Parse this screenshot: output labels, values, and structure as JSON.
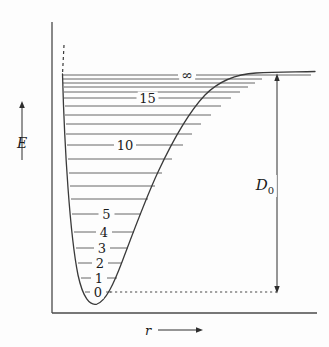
{
  "chart_data": {
    "type": "line",
    "title": "",
    "subtitle": "",
    "xlabel": "r",
    "ylabel": "E",
    "xlim": [
      0,
      1
    ],
    "ylim": [
      0,
      1
    ],
    "grid": false,
    "legend": null,
    "curve": {
      "name": "Morse potential V(r)",
      "color": "#3a3a3a",
      "asymptote_y_px": 75,
      "minimum": {
        "r_px": 96,
        "E_px": 302
      }
    },
    "dissociation_energy": {
      "label_base": "D",
      "label_sub": "0",
      "from_level": 0,
      "to_level": "dissociation limit",
      "arrow": "double-headed"
    },
    "levels": [
      {
        "v": "0",
        "label": "0",
        "y_px": 292,
        "x_left_px": 85,
        "x_right_px": 111,
        "labeled": true
      },
      {
        "v": "1",
        "label": "1",
        "y_px": 278,
        "x_left_px": 81,
        "x_right_px": 117,
        "labeled": true
      },
      {
        "v": "2",
        "label": "2",
        "y_px": 263,
        "x_left_px": 78,
        "x_right_px": 122,
        "labeled": true
      },
      {
        "v": "3",
        "label": "3",
        "y_px": 248,
        "x_left_px": 76,
        "x_right_px": 128,
        "labeled": true
      },
      {
        "v": "4",
        "label": "4",
        "y_px": 232,
        "x_left_px": 74,
        "x_right_px": 134,
        "labeled": true
      },
      {
        "v": "5",
        "label": "5",
        "y_px": 214,
        "x_left_px": 72,
        "x_right_px": 141,
        "labeled": true
      },
      {
        "v": "6",
        "label": "",
        "y_px": 199,
        "x_left_px": 71,
        "x_right_px": 148,
        "labeled": false
      },
      {
        "v": "7",
        "label": "",
        "y_px": 186,
        "x_left_px": 70,
        "x_right_px": 155,
        "labeled": false
      },
      {
        "v": "8",
        "label": "",
        "y_px": 173,
        "x_left_px": 69,
        "x_right_px": 162,
        "labeled": false
      },
      {
        "v": "9",
        "label": "",
        "y_px": 159,
        "x_left_px": 68,
        "x_right_px": 172,
        "labeled": false
      },
      {
        "v": "10",
        "label": "10",
        "y_px": 145,
        "x_left_px": 67,
        "x_right_px": 183,
        "labeled": true
      },
      {
        "v": "11",
        "label": "",
        "y_px": 134,
        "x_left_px": 66,
        "x_right_px": 192,
        "labeled": false
      },
      {
        "v": "12",
        "label": "",
        "y_px": 124,
        "x_left_px": 66,
        "x_right_px": 201,
        "labeled": false
      },
      {
        "v": "13",
        "label": "",
        "y_px": 115,
        "x_left_px": 65,
        "x_right_px": 211,
        "labeled": false
      },
      {
        "v": "14",
        "label": "",
        "y_px": 106,
        "x_left_px": 65,
        "x_right_px": 221,
        "labeled": false
      },
      {
        "v": "15",
        "label": "15",
        "y_px": 98,
        "x_left_px": 64,
        "x_right_px": 231,
        "labeled": true
      },
      {
        "v": "16",
        "label": "",
        "y_px": 92,
        "x_left_px": 64,
        "x_right_px": 240,
        "labeled": false
      },
      {
        "v": "17",
        "label": "",
        "y_px": 87,
        "x_left_px": 64,
        "x_right_px": 248,
        "labeled": false
      },
      {
        "v": "18",
        "label": "",
        "y_px": 83,
        "x_left_px": 63,
        "x_right_px": 255,
        "labeled": false
      },
      {
        "v": "19",
        "label": "",
        "y_px": 79,
        "x_left_px": 63,
        "x_right_px": 262,
        "labeled": false
      },
      {
        "v": "inf",
        "label": "∞",
        "y_px": 75,
        "x_left_px": 63,
        "x_right_px": 311,
        "labeled": true
      }
    ]
  },
  "axes": {
    "y": {
      "label": "E",
      "arrow_direction": "up",
      "arrow_x_px": 22,
      "arrow_top_px": 105,
      "arrow_bottom_px": 160
    },
    "x": {
      "label": "r",
      "arrow_direction": "right",
      "arrow_y_px": 330,
      "arrow_left_px": 158,
      "arrow_right_px": 200
    },
    "origin_px": {
      "x": 52,
      "y": 313
    },
    "frame_color": "#4a4a4a"
  },
  "annotations": {
    "dissociation_label": {
      "base": "D",
      "sub": "0"
    },
    "infinity_symbol": "∞",
    "zero_level_dotted_line": true,
    "repulsive_wall_dashed_top": true
  },
  "colors": {
    "background": "#fdfdfd",
    "curve": "#3a3a3a",
    "level_line": "#555555",
    "axis": "#4a4a4a",
    "text": "#1b1b1b",
    "dotted": "#4a4a4a"
  }
}
